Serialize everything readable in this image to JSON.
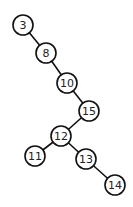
{
  "diagram": {
    "type": "binary-search-tree",
    "colors": {
      "stroke": "#111111",
      "fill": "#ffffff",
      "text": "#222222",
      "background": "#ffffff"
    },
    "node_radius": 10,
    "nodes": [
      {
        "id": "n3",
        "label": "3",
        "x": 23,
        "y": 25
      },
      {
        "id": "n8",
        "label": "8",
        "x": 46,
        "y": 53
      },
      {
        "id": "n10",
        "label": "10",
        "x": 67,
        "y": 83
      },
      {
        "id": "n15",
        "label": "15",
        "x": 89,
        "y": 111
      },
      {
        "id": "n12",
        "label": "12",
        "x": 61,
        "y": 136
      },
      {
        "id": "n11",
        "label": "11",
        "x": 35,
        "y": 156
      },
      {
        "id": "n13",
        "label": "13",
        "x": 86,
        "y": 159
      },
      {
        "id": "n14",
        "label": "14",
        "x": 115,
        "y": 185
      }
    ],
    "edges": [
      {
        "from": "n3",
        "to": "n8"
      },
      {
        "from": "n8",
        "to": "n10"
      },
      {
        "from": "n10",
        "to": "n15"
      },
      {
        "from": "n15",
        "to": "n12"
      },
      {
        "from": "n12",
        "to": "n11"
      },
      {
        "from": "n12",
        "to": "n13"
      },
      {
        "from": "n13",
        "to": "n14"
      }
    ]
  }
}
